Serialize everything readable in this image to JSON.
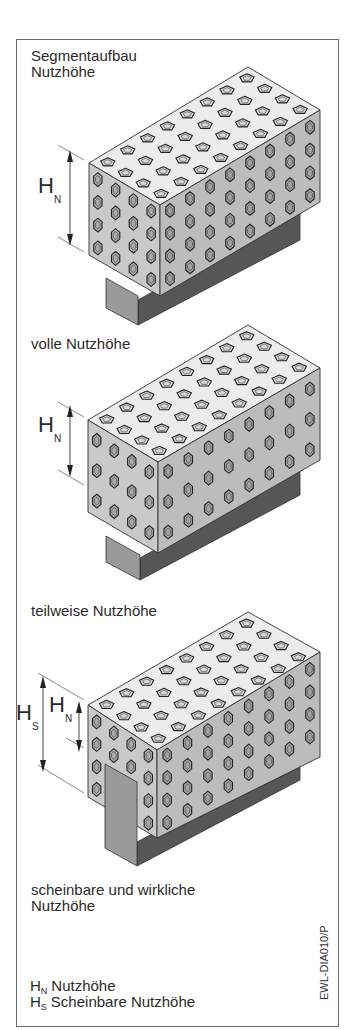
{
  "figure": {
    "sections": [
      {
        "title": "Segmentaufbau\nNutzhöhe",
        "top": 48
      },
      {
        "title": "volle Nutzhöhe",
        "top": 336
      },
      {
        "title": "teilweise Nutzhöhe",
        "top": 603
      },
      {
        "title": "scheinbare und wirkliche\nNutzhöhe",
        "top": 882
      }
    ],
    "dimension_labels": {
      "hn_main": "H",
      "hn_sub": "N",
      "hs_main": "H",
      "hs_sub": "S"
    },
    "legend": [
      {
        "symbol": "H",
        "sub": "N",
        "text": "Nutzhöhe"
      },
      {
        "symbol": "H",
        "sub": "S",
        "text": "Scheinbare Nutzhöhe"
      }
    ],
    "drawing_code": "EWL-DIA010/P"
  },
  "colors": {
    "top_face": "#ececec",
    "front_face": "#c9c9c9",
    "right_face": "#bcbcbc",
    "base_front": "#9a9a9a",
    "base_right": "#565656",
    "outline": "#333333",
    "border": "#6a6a6a"
  }
}
